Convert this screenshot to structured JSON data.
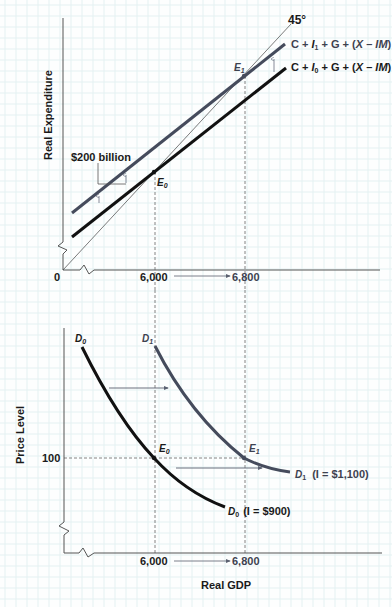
{
  "colors": {
    "background": "#fdfefe",
    "grid_minor": "#e4f1f2",
    "grid_major": "#cfe6e8",
    "axis": "#555555",
    "black_line": "#111111",
    "gray_line": "#454b5c",
    "arrow": "#5a6070",
    "dashed": "#666666"
  },
  "top_panel": {
    "ylabel": "Real Expenditure",
    "origin_label": "0",
    "x_tick_1": "6,000",
    "x_tick_2": "6,800",
    "angle_label": "45°",
    "line_upper": {
      "prefix": "C + ",
      "i": "I",
      "sub": "1",
      "suffix": " + G + (",
      "x": "X",
      "dash": " – ",
      "im": "IM",
      "close": ")"
    },
    "line_lower": {
      "prefix": "C + ",
      "i": "I",
      "sub": "0",
      "suffix": " + G + (",
      "x": "X",
      "dash": " – ",
      "im": "IM",
      "close": ")"
    },
    "shift_label": "$200 billion",
    "eq0": {
      "e": "E",
      "sub": "0"
    },
    "eq1": {
      "e": "E",
      "sub": "1"
    }
  },
  "bottom_panel": {
    "ylabel": "Price Level",
    "xlabel": "Real GDP",
    "y_tick": "100",
    "x_tick_1": "6,000",
    "x_tick_2": "6,800",
    "d0_top": {
      "d": "D",
      "sub": "0"
    },
    "d1_top": {
      "d": "D",
      "sub": "1"
    },
    "d0_end": {
      "d": "D",
      "sub": "0",
      "note": "(I = $900)"
    },
    "d1_end": {
      "d": "D",
      "sub": "1",
      "note": "(I = $1,100)"
    },
    "eq0": {
      "e": "E",
      "sub": "0"
    },
    "eq1": {
      "e": "E",
      "sub": "1"
    }
  },
  "chart_data": [
    {
      "type": "line",
      "title": "Income-expenditure diagram: investment increase",
      "xlabel": "Real GDP",
      "ylabel": "Real Expenditure",
      "x_ticks": [
        "0",
        "6,000",
        "6,800"
      ],
      "series": [
        {
          "name": "45° line",
          "x": [
            0,
            6800
          ],
          "y": [
            0,
            6800
          ]
        },
        {
          "name": "C + I0 + G + (X – IM)",
          "x": [
            6000
          ],
          "y": [
            6000
          ],
          "slope": 0.75
        },
        {
          "name": "C + I1 + G + (X – IM)",
          "x": [
            6800
          ],
          "y": [
            6800
          ],
          "slope": 0.75
        }
      ],
      "annotations": [
        {
          "text": "E0",
          "x": 6000,
          "y": 6000
        },
        {
          "text": "E1",
          "x": 6800,
          "y": 6800
        },
        {
          "text": "$200 billion",
          "meaning": "vertical upward shift of expenditure schedule"
        },
        {
          "text": "45°"
        }
      ],
      "grid": true
    },
    {
      "type": "line",
      "title": "Aggregate demand curves shift",
      "xlabel": "Real GDP",
      "ylabel": "Price Level",
      "x_ticks": [
        "6,000",
        "6,800"
      ],
      "y_ticks": [
        "100"
      ],
      "series": [
        {
          "name": "D0 (I = $900)",
          "points": [
            {
              "x": 6000,
              "y": 100
            }
          ]
        },
        {
          "name": "D1 (I = $1,100)",
          "points": [
            {
              "x": 6800,
              "y": 100
            }
          ]
        }
      ],
      "annotations": [
        {
          "text": "E0",
          "x": 6000,
          "y": 100
        },
        {
          "text": "E1",
          "x": 6800,
          "y": 100
        },
        {
          "text": "arrow",
          "meaning": "rightward shift of D0 to D1"
        }
      ],
      "grid": true
    }
  ]
}
